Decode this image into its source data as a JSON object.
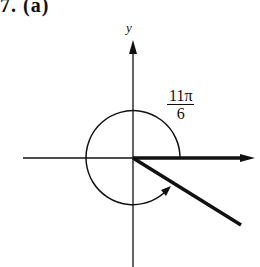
{
  "figure": {
    "part_label": "7. (a)",
    "y_axis_label": "y",
    "angle": {
      "numerator": "11π",
      "denominator": "6",
      "radians_text": "11π/6",
      "degrees": 330
    },
    "colors": {
      "ink": "#111111",
      "background": "#ffffff"
    }
  }
}
